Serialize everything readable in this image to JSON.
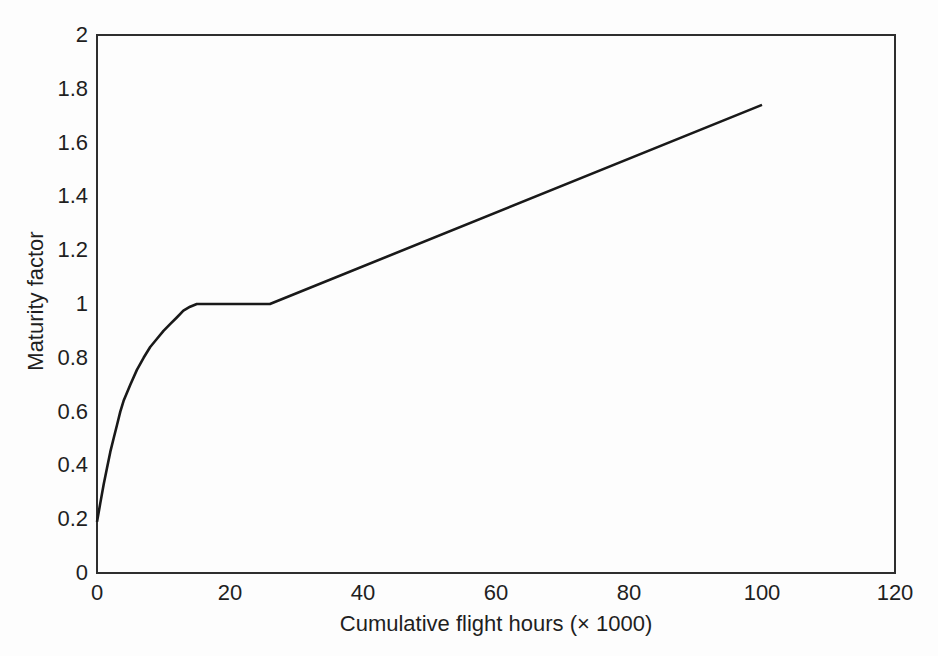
{
  "figure": {
    "background_color": "#fdfdfd",
    "axis_color": "#2e2e2e",
    "curve_color": "#191919",
    "text_color": "#1f1f1f"
  },
  "chart_data": {
    "type": "line",
    "title": "",
    "xlabel": "Cumulative flight hours (× 1000)",
    "ylabel": "Maturity factor",
    "xlim": [
      0,
      120
    ],
    "ylim": [
      0,
      2
    ],
    "x_ticks": [
      0,
      20,
      40,
      60,
      80,
      100,
      120
    ],
    "y_ticks": [
      0,
      0.2,
      0.4,
      0.6,
      0.8,
      1,
      1.2,
      1.4,
      1.6,
      1.8,
      2
    ],
    "grid": false,
    "legend_position": "none",
    "series": [
      {
        "name": "maturity-factor-curve",
        "points": [
          [
            0,
            0.19
          ],
          [
            0.5,
            0.26
          ],
          [
            1,
            0.33
          ],
          [
            1.5,
            0.39
          ],
          [
            2,
            0.45
          ],
          [
            2.5,
            0.5
          ],
          [
            3,
            0.55
          ],
          [
            3.5,
            0.6
          ],
          [
            4,
            0.64
          ],
          [
            5,
            0.7
          ],
          [
            6,
            0.755
          ],
          [
            7,
            0.8
          ],
          [
            8,
            0.84
          ],
          [
            9,
            0.87
          ],
          [
            10,
            0.9
          ],
          [
            11,
            0.925
          ],
          [
            12,
            0.95
          ],
          [
            13,
            0.975
          ],
          [
            14,
            0.99
          ],
          [
            15,
            1
          ],
          [
            26,
            1
          ],
          [
            100,
            1.74
          ]
        ]
      }
    ]
  }
}
